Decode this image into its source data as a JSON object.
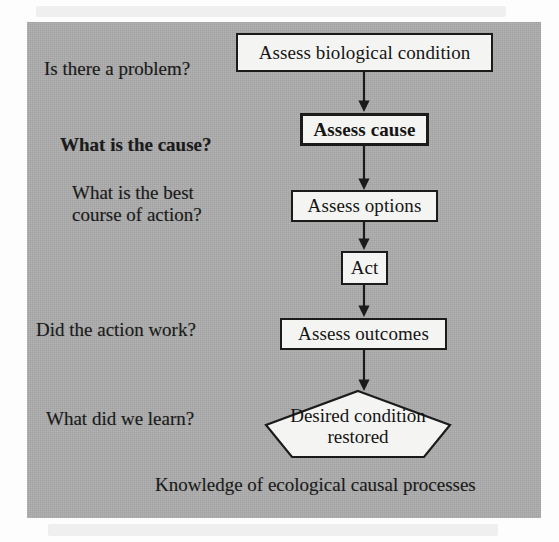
{
  "figure": {
    "background_color": "#adadad",
    "node_fill_color": "#f4f4f2",
    "stroke_color": "#1b1b1b",
    "caption": "Knowledge of ecological causal processes"
  },
  "questions": [
    {
      "text": "Is there a problem?",
      "emphasis": "normal"
    },
    {
      "text": "What is the cause?",
      "emphasis": "bold"
    },
    {
      "text": "What is the best\ncourse of action?",
      "emphasis": "normal"
    },
    {
      "text": "Did the action work?",
      "emphasis": "normal"
    },
    {
      "text": "What did we learn?",
      "emphasis": "normal"
    }
  ],
  "nodes": [
    {
      "label": "Assess biological condition",
      "shape": "rectangle",
      "emphasis": "normal"
    },
    {
      "label": "Assess cause",
      "shape": "rectangle",
      "emphasis": "bold"
    },
    {
      "label": "Assess options",
      "shape": "rectangle",
      "emphasis": "normal"
    },
    {
      "label": "Act",
      "shape": "rectangle",
      "emphasis": "normal"
    },
    {
      "label": "Assess outcomes",
      "shape": "rectangle",
      "emphasis": "normal"
    },
    {
      "label": "Desired condition\nrestored",
      "shape": "pentagon",
      "emphasis": "normal"
    }
  ],
  "connections": [
    {
      "from": "Assess biological condition",
      "to": "Assess cause",
      "style": "arrow-down"
    },
    {
      "from": "Assess cause",
      "to": "Assess options",
      "style": "arrow-down"
    },
    {
      "from": "Assess options",
      "to": "Act",
      "style": "arrow-down"
    },
    {
      "from": "Act",
      "to": "Assess outcomes",
      "style": "arrow-down"
    },
    {
      "from": "Assess outcomes",
      "to": "Desired condition restored",
      "style": "arrow-down"
    }
  ]
}
